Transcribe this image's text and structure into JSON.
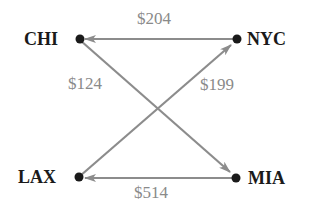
{
  "nodes": {
    "chi": {
      "label": "CHI"
    },
    "nyc": {
      "label": "NYC"
    },
    "lax": {
      "label": "LAX"
    },
    "mia": {
      "label": "MIA"
    }
  },
  "edges": [
    {
      "from": "NYC",
      "to": "CHI",
      "label": "$204"
    },
    {
      "from": "CHI",
      "to": "MIA",
      "label": "$124"
    },
    {
      "from": "LAX",
      "to": "NYC",
      "label": "$199"
    },
    {
      "from": "MIA",
      "to": "LAX",
      "label": "$514"
    }
  ],
  "colors": {
    "edge": "#8c8c8c",
    "node": "#1a1a1a",
    "edge_label": "#8a8a8a"
  }
}
